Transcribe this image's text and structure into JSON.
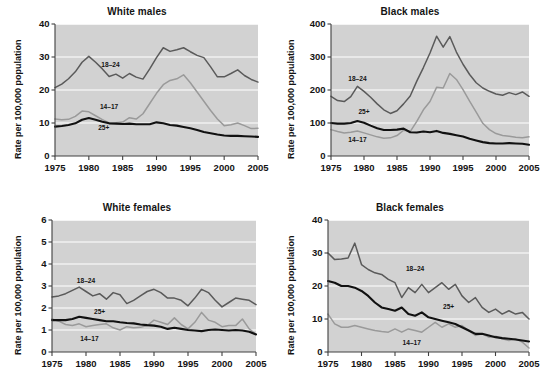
{
  "figure": {
    "ylabel": "Rate per 100,000 population",
    "xlabel": "",
    "x_ticks": [
      1975,
      1980,
      1985,
      1990,
      1995,
      2000,
      2005
    ],
    "xlim": [
      1975,
      2005
    ],
    "background": "#ffffff",
    "plot_background": "#d2d2d2",
    "gridline_color": "#ffffff",
    "series_colors": {
      "14-17": "#9a9a9a",
      "18-24": "#5a5a5a",
      "25+": "#111111"
    }
  },
  "chart_data": [
    {
      "type": "line",
      "title": "White males",
      "xlabel": "",
      "ylabel": "Rate per 100,000 population",
      "xlim": [
        1975,
        2005
      ],
      "ylim": [
        0,
        40
      ],
      "y_ticks": [
        0,
        10,
        20,
        30,
        40
      ],
      "x_ticks": [
        1975,
        1980,
        1985,
        1990,
        1995,
        2000,
        2005
      ],
      "grid": true,
      "legend_position": "inline-annotations",
      "x": [
        1975,
        1976,
        1977,
        1978,
        1979,
        1980,
        1981,
        1982,
        1983,
        1984,
        1985,
        1986,
        1987,
        1988,
        1989,
        1990,
        1991,
        1992,
        1993,
        1994,
        1995,
        1996,
        1997,
        1998,
        1999,
        2000,
        2001,
        2002,
        2003,
        2004,
        2005
      ],
      "series": [
        {
          "name": "18-24",
          "label": "18–24",
          "color": "#5a5a5a",
          "label_xy": [
            1983.2,
            27.0
          ],
          "values": [
            20.7,
            21.8,
            23.4,
            25.5,
            28.4,
            30.2,
            28.4,
            26.4,
            24.1,
            24.8,
            23.6,
            25.0,
            23.9,
            23.3,
            26.4,
            29.8,
            32.8,
            31.7,
            32.2,
            32.8,
            31.6,
            30.5,
            29.8,
            27.0,
            24.0,
            24.0,
            25.0,
            26.1,
            24.4,
            23.2,
            22.4
          ]
        },
        {
          "name": "14-17",
          "label": "14–17",
          "color": "#9a9a9a",
          "label_xy": [
            1983.0,
            14.2
          ],
          "values": [
            11.2,
            11.0,
            11.1,
            12.0,
            13.6,
            13.4,
            12.2,
            11.0,
            10.0,
            10.1,
            10.3,
            11.6,
            11.2,
            12.8,
            15.9,
            19.0,
            21.6,
            22.9,
            23.4,
            24.6,
            22.2,
            19.4,
            16.6,
            13.8,
            11.2,
            9.2,
            9.5,
            10.0,
            9.2,
            8.3,
            8.4
          ]
        },
        {
          "name": "25+",
          "label": "25+",
          "color": "#111111",
          "label_xy": [
            1982.2,
            7.9
          ],
          "values": [
            8.9,
            9.1,
            9.4,
            9.9,
            11.0,
            11.5,
            11.0,
            10.4,
            9.9,
            9.8,
            9.7,
            9.8,
            9.6,
            9.6,
            9.6,
            10.2,
            9.9,
            9.4,
            9.2,
            8.8,
            8.4,
            7.9,
            7.3,
            6.9,
            6.5,
            6.2,
            6.1,
            6.1,
            6.0,
            5.9,
            5.8
          ]
        }
      ]
    },
    {
      "type": "line",
      "title": "Black males",
      "xlabel": "",
      "ylabel": "Rate per 100,000 population",
      "xlim": [
        1975,
        2005
      ],
      "ylim": [
        0,
        400
      ],
      "y_ticks": [
        0,
        100,
        200,
        300,
        400
      ],
      "x_ticks": [
        1975,
        1980,
        1985,
        1990,
        1995,
        2000,
        2005
      ],
      "grid": true,
      "legend_position": "inline-annotations",
      "x": [
        1975,
        1976,
        1977,
        1978,
        1979,
        1980,
        1981,
        1982,
        1983,
        1984,
        1985,
        1986,
        1987,
        1988,
        1989,
        1990,
        1991,
        1992,
        1993,
        1994,
        1995,
        1996,
        1997,
        1998,
        1999,
        2000,
        2001,
        2002,
        2003,
        2004,
        2005
      ],
      "series": [
        {
          "name": "18-24",
          "label": "18–24",
          "color": "#5a5a5a",
          "label_xy": [
            1979.0,
            227.0
          ],
          "values": [
            181,
            168,
            165,
            180,
            211,
            196,
            178,
            158,
            140,
            129,
            137,
            158,
            182,
            227,
            268,
            312,
            363,
            330,
            362,
            315,
            278,
            247,
            222,
            206,
            196,
            188,
            184,
            192,
            186,
            194,
            181
          ]
        },
        {
          "name": "25+",
          "label": "25+",
          "color": "#111111",
          "label_xy": [
            1980.0,
            128.0
          ],
          "values": [
            100,
            98,
            98,
            100,
            106,
            101,
            92,
            84,
            79,
            79,
            80,
            83,
            72,
            71,
            74,
            72,
            76,
            70,
            67,
            63,
            59,
            52,
            47,
            42,
            39,
            38,
            38,
            39,
            38,
            37,
            34
          ]
        },
        {
          "name": "14-17",
          "label": "14–17",
          "color": "#9a9a9a",
          "label_xy": [
            1979.0,
            42.0
          ],
          "values": [
            80,
            74,
            70,
            72,
            76,
            70,
            64,
            58,
            54,
            55,
            62,
            78,
            74,
            105,
            140,
            165,
            208,
            206,
            250,
            232,
            201,
            166,
            133,
            99,
            80,
            68,
            62,
            60,
            57,
            55,
            58
          ]
        }
      ]
    },
    {
      "type": "line",
      "title": "White females",
      "xlabel": "",
      "ylabel": "Rate per 100,000 population",
      "xlim": [
        1975,
        2005
      ],
      "ylim": [
        0,
        6
      ],
      "y_ticks": [
        0,
        1,
        2,
        3,
        4,
        5,
        6
      ],
      "x_ticks": [
        1975,
        1980,
        1985,
        1990,
        1995,
        2000,
        2005
      ],
      "grid": true,
      "legend_position": "inline-annotations",
      "x": [
        1975,
        1976,
        1977,
        1978,
        1979,
        1980,
        1981,
        1982,
        1983,
        1984,
        1985,
        1986,
        1987,
        1988,
        1989,
        1990,
        1991,
        1992,
        1993,
        1994,
        1995,
        1996,
        1997,
        1998,
        1999,
        2000,
        2001,
        2002,
        2003,
        2004,
        2005
      ],
      "series": [
        {
          "name": "18-24",
          "label": "18–24",
          "color": "#5a5a5a",
          "label_xy": [
            1980.0,
            3.15
          ],
          "values": [
            2.5,
            2.55,
            2.65,
            2.8,
            2.95,
            2.75,
            2.55,
            2.65,
            2.4,
            2.7,
            2.6,
            2.2,
            2.35,
            2.55,
            2.75,
            2.85,
            2.7,
            2.45,
            2.45,
            2.35,
            2.1,
            2.45,
            2.85,
            2.7,
            2.35,
            2.05,
            2.25,
            2.45,
            2.4,
            2.35,
            2.15
          ]
        },
        {
          "name": "25+",
          "label": "25+",
          "color": "#111111",
          "label_xy": [
            1982.0,
            1.75
          ],
          "values": [
            1.45,
            1.45,
            1.45,
            1.5,
            1.6,
            1.55,
            1.5,
            1.45,
            1.4,
            1.4,
            1.35,
            1.32,
            1.3,
            1.25,
            1.22,
            1.2,
            1.15,
            1.05,
            1.1,
            1.05,
            1.0,
            0.98,
            0.95,
            1.0,
            1.02,
            1.0,
            0.98,
            1.0,
            0.98,
            0.92,
            0.8
          ]
        },
        {
          "name": "14-17",
          "label": "14–17",
          "color": "#9a9a9a",
          "label_xy": [
            1980.5,
            0.52
          ],
          "values": [
            1.5,
            1.4,
            1.25,
            1.2,
            1.28,
            1.15,
            1.2,
            1.25,
            1.28,
            1.1,
            1.0,
            1.15,
            1.1,
            1.12,
            1.2,
            1.45,
            1.35,
            1.25,
            1.55,
            1.25,
            1.05,
            1.35,
            1.8,
            1.45,
            1.35,
            1.15,
            1.2,
            1.2,
            1.5,
            1.05,
            0.8
          ]
        }
      ]
    },
    {
      "type": "line",
      "title": "Black females",
      "xlabel": "",
      "ylabel": "Rate per 100,000 population",
      "xlim": [
        1975,
        2005
      ],
      "ylim": [
        0,
        40
      ],
      "y_ticks": [
        0,
        10,
        20,
        30,
        40
      ],
      "x_ticks": [
        1975,
        1980,
        1985,
        1990,
        1995,
        2000,
        2005
      ],
      "grid": true,
      "legend_position": "inline-annotations",
      "x": [
        1975,
        1976,
        1977,
        1978,
        1979,
        1980,
        1981,
        1982,
        1983,
        1984,
        1985,
        1986,
        1987,
        1988,
        1989,
        1990,
        1991,
        1992,
        1993,
        1994,
        1995,
        1996,
        1997,
        1998,
        1999,
        2000,
        2001,
        2002,
        2003,
        2004,
        2005
      ],
      "series": [
        {
          "name": "18-24",
          "label": "18–24",
          "color": "#5a5a5a",
          "label_xy": [
            1988.0,
            24.5
          ],
          "values": [
            30.0,
            28.0,
            28.2,
            28.5,
            33.0,
            26.5,
            25.0,
            24.0,
            23.5,
            22.0,
            21.0,
            16.5,
            19.5,
            18.0,
            20.5,
            18.0,
            19.5,
            21.0,
            19.0,
            20.5,
            17.0,
            15.0,
            16.5,
            13.5,
            12.0,
            13.0,
            11.5,
            12.5,
            11.5,
            12.0,
            10.0
          ]
        },
        {
          "name": "25+",
          "label": "25+",
          "color": "#111111",
          "label_xy": [
            1993.0,
            13.0
          ],
          "values": [
            21.5,
            21.0,
            20.0,
            20.0,
            19.5,
            18.5,
            17.0,
            15.0,
            13.5,
            13.0,
            12.5,
            13.5,
            11.5,
            11.0,
            12.0,
            10.5,
            10.0,
            9.5,
            9.0,
            8.5,
            7.5,
            6.5,
            5.5,
            5.5,
            5.0,
            4.5,
            4.2,
            4.0,
            3.8,
            3.5,
            3.2
          ]
        },
        {
          "name": "14-17",
          "label": "14–17",
          "color": "#9a9a9a",
          "label_xy": [
            1987.5,
            2.0
          ],
          "values": [
            11.5,
            8.5,
            7.5,
            7.5,
            8.0,
            7.5,
            7.0,
            6.5,
            6.2,
            6.0,
            7.0,
            6.0,
            7.0,
            6.5,
            6.0,
            7.5,
            9.0,
            7.5,
            8.5,
            7.5,
            8.0,
            6.5,
            5.0,
            5.5,
            4.5,
            4.8,
            4.0,
            3.5,
            4.0,
            3.0,
            1.2
          ]
        }
      ]
    }
  ]
}
